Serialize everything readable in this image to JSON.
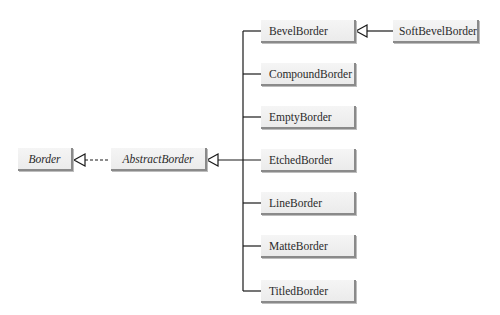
{
  "diagram": {
    "type": "UML class hierarchy",
    "interface": {
      "name": "Border",
      "italic": true
    },
    "abstract_class": {
      "name": "AbstractBorder",
      "italic": true,
      "relation_to_interface": "implements (dashed, hollow triangle)"
    },
    "subclasses": [
      {
        "name": "BevelBorder"
      },
      {
        "name": "CompoundBorder"
      },
      {
        "name": "EmptyBorder"
      },
      {
        "name": "EtchedBorder"
      },
      {
        "name": "LineBorder"
      },
      {
        "name": "MatteBorder"
      },
      {
        "name": "TitledBorder"
      }
    ],
    "sub_subclass": {
      "name": "SoftBevelBorder",
      "parent": "BevelBorder",
      "relation": "extends (solid, hollow triangle)"
    },
    "colors": {
      "box_fill_top": "#f5f5f5",
      "box_fill_bottom": "#ebebeb",
      "box_shadow": "#8a8a8a",
      "line": "#1a1a1a",
      "text": "#2a2a2a"
    }
  }
}
